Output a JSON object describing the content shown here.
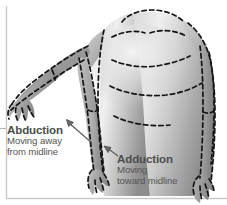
{
  "figure": {
    "kind": "anatomy-illustration",
    "background_color": "#ffffff",
    "frame": {
      "left_rule_color": "#c9c9c9",
      "bottom_rule_color": "#c9c9c9",
      "tick_color": "#b0b0b0"
    },
    "body": {
      "fill_light": "#e8e8e8",
      "fill_mid": "#b9b9b9",
      "fill_dark": "#8f8f8f",
      "outline_color": "#1a1a1a",
      "outline_style": "dashed"
    }
  },
  "annotations": [
    {
      "id": "abduction",
      "title": "Abduction",
      "sub_line_1": "Moving away",
      "sub_line_2": "from midline",
      "arrow": "pointer-up-left",
      "points_to": "left-arm-raised"
    },
    {
      "id": "adduction",
      "title": "Adduction",
      "sub_line_1": "Moving",
      "sub_line_2": "toward midline",
      "arrow": "pointer-up-left",
      "points_to": "right-arm-at-side"
    }
  ],
  "text_color": "#4d4d4d"
}
